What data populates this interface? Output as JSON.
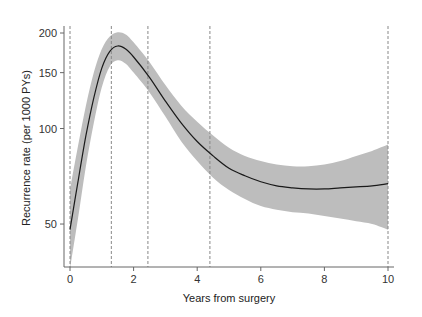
{
  "chart_data": {
    "type": "line",
    "title": "",
    "xlabel": "Years from surgery",
    "ylabel": "Recurrence rate (per 1000 PYs)",
    "xlim": [
      0,
      10
    ],
    "ylim": [
      38,
      205
    ],
    "y_scale": "log",
    "grid": false,
    "legend": null,
    "x_ticks": [
      0,
      2,
      4,
      6,
      8,
      10
    ],
    "y_ticks": [
      50,
      100,
      150,
      200
    ],
    "x_tick_labels": [
      "0",
      "2",
      "4",
      "6",
      "8",
      "10"
    ],
    "y_tick_labels": [
      "50",
      "100",
      "150",
      "200"
    ],
    "vertical_reference_lines": [
      0,
      1.3,
      2.45,
      4.4,
      10
    ],
    "series": [
      {
        "name": "Recurrence rate",
        "x": [
          0.0,
          0.25,
          0.5,
          0.75,
          1.0,
          1.25,
          1.5,
          1.75,
          2.0,
          2.5,
          3.0,
          3.5,
          4.0,
          4.5,
          5.0,
          5.5,
          6.0,
          6.5,
          7.0,
          7.5,
          8.0,
          8.5,
          9.0,
          9.5,
          10.0
        ],
        "values": [
          48,
          68,
          95,
          125,
          155,
          175,
          182,
          178,
          168,
          145,
          122,
          104,
          91,
          82,
          75,
          71,
          68,
          66,
          65,
          64.5,
          64.5,
          65,
          65.5,
          66,
          67
        ],
        "ci_lower": [
          36,
          52,
          76,
          104,
          135,
          157,
          164,
          160,
          150,
          130,
          109,
          91,
          79,
          70,
          64,
          60,
          57,
          55.5,
          54.5,
          54,
          53,
          52,
          51,
          50,
          48
        ],
        "ci_upper": [
          64,
          88,
          118,
          150,
          178,
          195,
          201,
          198,
          187,
          162,
          137,
          118,
          105,
          95,
          87,
          82,
          79,
          77,
          76,
          76,
          77,
          79,
          82,
          85,
          89
        ]
      }
    ]
  },
  "axes": {
    "x_title": "Years from surgery",
    "y_title": "Recurrence rate (per 1000 PYs)"
  },
  "colors": {
    "line": "#1a1a1a",
    "band": "#bdbdbd",
    "axis": "#555555",
    "refline": "#888888",
    "background": "#ffffff"
  }
}
